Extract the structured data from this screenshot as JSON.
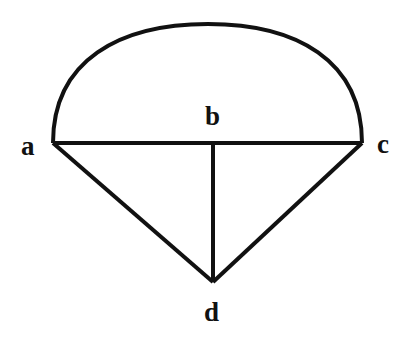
{
  "diagram": {
    "nodes": [
      {
        "id": "a",
        "label": "a",
        "x": 53,
        "y": 143
      },
      {
        "id": "b",
        "label": "b",
        "x": 213,
        "y": 143
      },
      {
        "id": "c",
        "label": "c",
        "x": 362,
        "y": 143
      },
      {
        "id": "d",
        "label": "d",
        "x": 213,
        "y": 282
      }
    ],
    "edges": [
      {
        "from": "a",
        "to": "c",
        "type": "straight"
      },
      {
        "from": "a",
        "to": "c",
        "type": "arc"
      },
      {
        "from": "b",
        "to": "d",
        "type": "straight"
      },
      {
        "from": "a",
        "to": "d",
        "type": "straight"
      },
      {
        "from": "c",
        "to": "d",
        "type": "straight"
      }
    ],
    "stroke_color": "#111111"
  }
}
